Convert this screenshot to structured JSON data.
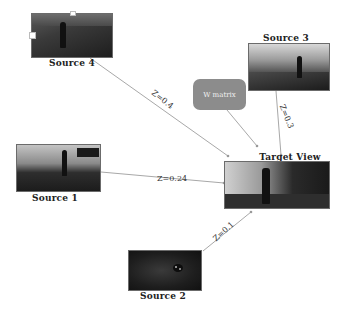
{
  "diagram": {
    "nodes": [
      {
        "id": "source4",
        "label": "Source 4"
      },
      {
        "id": "source3",
        "label": "Source 3"
      },
      {
        "id": "source1",
        "label": "Source 1"
      },
      {
        "id": "source2",
        "label": "Source 2"
      },
      {
        "id": "target",
        "label": "Target View"
      },
      {
        "id": "wmatrix",
        "label": "W matrix"
      }
    ],
    "edges": [
      {
        "from": "source4",
        "to": "target",
        "label": "Z=0.4"
      },
      {
        "from": "source3",
        "to": "target",
        "label": "Z=0.3"
      },
      {
        "from": "source1",
        "to": "target",
        "label": "Z=0.24"
      },
      {
        "from": "source2",
        "to": "target",
        "label": "Z=0.1"
      },
      {
        "from": "wmatrix",
        "to": "target",
        "label": ""
      }
    ],
    "colors": {
      "edge": "#a8a8a8",
      "wbox": "#8c8c8c",
      "background": "#ffffff"
    }
  }
}
